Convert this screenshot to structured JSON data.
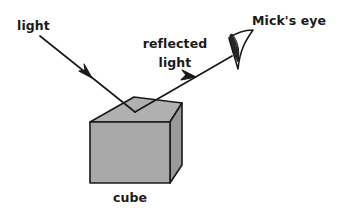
{
  "figure": {
    "title_text": "",
    "background_color": "#ffffff",
    "stroke_color": "#1a1a1a",
    "cube_face_color": "#a8a8a8",
    "cube_top_color": "#b0b0b0",
    "cube_side_color": "#9a9a9a",
    "pupil_color": "#262626"
  },
  "labels": {
    "incident_light": "light",
    "reflected_light_line1": "reflected",
    "reflected_light_line2": "light",
    "eye": "Mick's eye",
    "cube": "cube"
  },
  "diagram_data": {
    "type": "physics-ray-diagram",
    "subject": "specular reflection of light from a cube surface into an observer's eye",
    "elements": [
      {
        "name": "incident-ray",
        "label": "light",
        "kind": "arrow",
        "from": [
          40,
          36
        ],
        "to": [
          135,
          112
        ],
        "arrowhead_at": [
          88,
          74
        ],
        "arrowhead_direction": "down-right"
      },
      {
        "name": "reflected-ray",
        "label": "reflected light",
        "kind": "arrow",
        "from": [
          135,
          112
        ],
        "to": [
          232,
          56
        ],
        "arrowhead_at": [
          191,
          80
        ],
        "arrowhead_direction": "up-right"
      },
      {
        "name": "cube",
        "label": "cube",
        "kind": "solid-3d-cube",
        "front_face": [
          [
            90,
            122
          ],
          [
            90,
            183
          ],
          [
            170,
            183
          ],
          [
            170,
            122
          ]
        ],
        "top_face": [
          [
            90,
            122
          ],
          [
            134,
            97
          ],
          [
            182,
            103
          ],
          [
            170,
            122
          ]
        ],
        "right_face": [
          [
            170,
            122
          ],
          [
            182,
            103
          ],
          [
            182,
            165
          ],
          [
            170,
            183
          ]
        ]
      },
      {
        "name": "eye",
        "label": "Mick's eye",
        "kind": "eye-outline-with-pupil",
        "apex": [
          252,
          31
        ],
        "bottom": [
          240,
          69
        ],
        "pupil_center": [
          237,
          46
        ]
      }
    ],
    "label_positions": {
      "incident_light": [
        17,
        30
      ],
      "reflected_light_line1": [
        175,
        48
      ],
      "reflected_light_line2": [
        175,
        67
      ],
      "eye": [
        252,
        25
      ],
      "cube": [
        130,
        201
      ]
    }
  }
}
